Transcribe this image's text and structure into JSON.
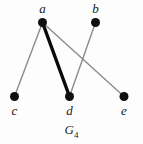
{
  "figure": {
    "caption_base": "G",
    "caption_subscript": "4",
    "background_color": "#fdfdfd"
  },
  "graph": {
    "vertices": [
      {
        "id": "a",
        "label": "a",
        "cx": 42.5,
        "cy": 22.5,
        "r": 4.5,
        "color": "#101010",
        "label_x": 42.5,
        "label_y": 2
      },
      {
        "id": "b",
        "label": "b",
        "cx": 95.5,
        "cy": 22.5,
        "r": 4.5,
        "color": "#101010",
        "label_x": 95.5,
        "label_y": 2
      },
      {
        "id": "c",
        "label": "c",
        "cx": 14.5,
        "cy": 96.5,
        "r": 4.5,
        "color": "#101010",
        "label_x": 14.5,
        "label_y": 104
      },
      {
        "id": "d",
        "label": "d",
        "cx": 69.5,
        "cy": 96.5,
        "r": 4.5,
        "color": "#101010",
        "label_x": 69.5,
        "label_y": 104
      },
      {
        "id": "e",
        "label": "e",
        "cx": 124.0,
        "cy": 96.5,
        "r": 4.5,
        "color": "#101010",
        "label_x": 124.0,
        "label_y": 104
      }
    ],
    "edges": [
      {
        "from": "a",
        "to": "c",
        "x1": 42.5,
        "y1": 22.5,
        "x2": 14.5,
        "y2": 96.5,
        "color": "#8c8c8c",
        "width": 1.4,
        "emphasis": "normal"
      },
      {
        "from": "a",
        "to": "d",
        "x1": 42.5,
        "y1": 22.5,
        "x2": 69.5,
        "y2": 96.5,
        "color": "#0a0a0a",
        "width": 3.4,
        "emphasis": "bold"
      },
      {
        "from": "a",
        "to": "e",
        "x1": 42.5,
        "y1": 22.5,
        "x2": 124.0,
        "y2": 96.5,
        "color": "#8c8c8c",
        "width": 1.4,
        "emphasis": "normal"
      },
      {
        "from": "b",
        "to": "d",
        "x1": 95.5,
        "y1": 22.5,
        "x2": 69.5,
        "y2": 96.5,
        "color": "#8c8c8c",
        "width": 1.4,
        "emphasis": "normal"
      }
    ]
  }
}
